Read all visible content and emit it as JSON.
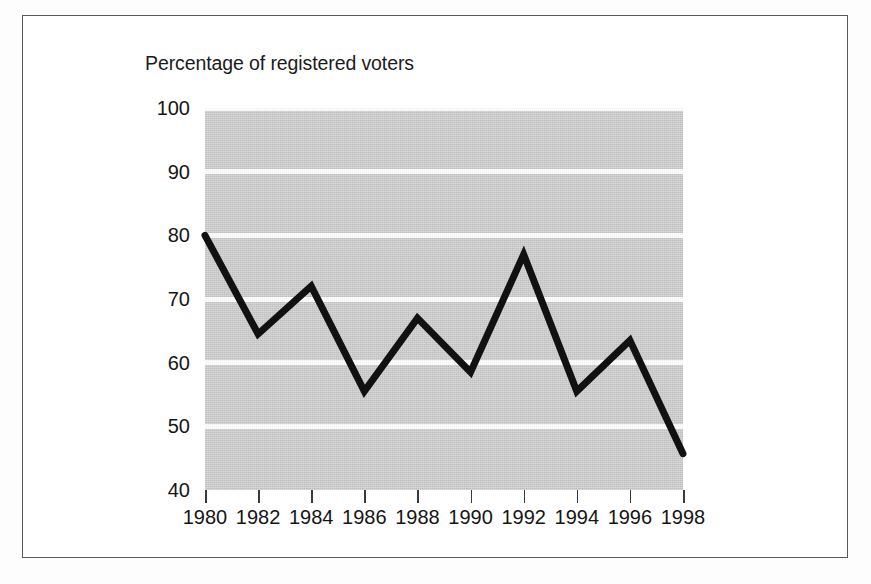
{
  "chart_data": {
    "type": "line",
    "title": "Percentage of registered voters",
    "xlabel": "",
    "ylabel": "Percentage of registered voters",
    "x": [
      1980,
      1982,
      1984,
      1986,
      1988,
      1990,
      1992,
      1994,
      1996,
      1998
    ],
    "categories": [
      "1980",
      "1982",
      "1984",
      "1986",
      "1988",
      "1990",
      "1992",
      "1994",
      "1996",
      "1998"
    ],
    "values": [
      80,
      64.5,
      72,
      55.5,
      67,
      58.5,
      77,
      55.5,
      63.5,
      45.7
    ],
    "series": [
      {
        "name": "Percentage of registered voters",
        "values": [
          80,
          64.5,
          72,
          55.5,
          67,
          58.5,
          77,
          55.5,
          63.5,
          45.7
        ]
      }
    ],
    "ylim": [
      40,
      100
    ],
    "xlim": [
      1980,
      1998
    ],
    "yticks": [
      40,
      50,
      60,
      70,
      80,
      90,
      100
    ],
    "ytick_labels": [
      "40",
      "50",
      "60",
      "70",
      "80",
      "90",
      "100"
    ],
    "xticks": [
      1980,
      1982,
      1984,
      1986,
      1988,
      1990,
      1992,
      1994,
      1996,
      1998
    ],
    "grid": true,
    "grid_orientation": "horizontal",
    "legend": false,
    "legend_position": "none",
    "colors": {
      "line": "#111111",
      "plot_background": "#c9c9c9",
      "gridline": "#ffffff",
      "frame_border": "#5a5a5e",
      "text": "#151515",
      "page_background": "#ffffff"
    },
    "line_width_px": 7
  },
  "figure": {
    "title": "Percentage of registered voters"
  }
}
